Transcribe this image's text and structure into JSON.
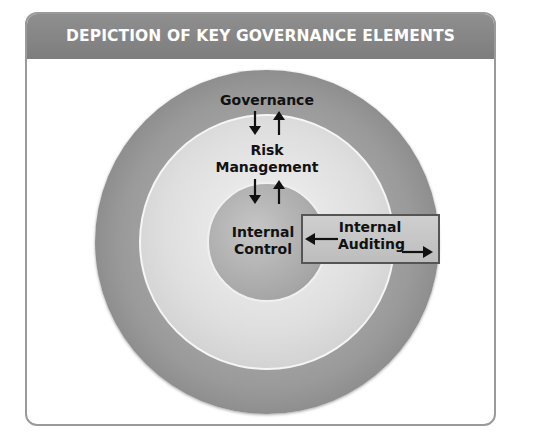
{
  "title": "DEPICTION OF KEY GOVERNANCE ELEMENTS",
  "layers": {
    "outer": {
      "label": "Governance"
    },
    "middle": {
      "label_line1": "Risk",
      "label_line2": "Management"
    },
    "inner": {
      "label_line1": "Internal",
      "label_line2": "Control"
    }
  },
  "side_box": {
    "label_line1": "Internal",
    "label_line2": "Auditing"
  },
  "relationships": [
    {
      "from": "Governance",
      "to": "Risk Management",
      "direction": "bidirectional"
    },
    {
      "from": "Risk Management",
      "to": "Internal Control",
      "direction": "bidirectional"
    },
    {
      "from": "Internal Auditing",
      "to": "Internal Control",
      "direction": "left"
    },
    {
      "from": "Internal Auditing",
      "to": "outside",
      "direction": "right"
    }
  ],
  "colors": {
    "header": "#888888",
    "frame_border": "#9a9a9a",
    "text": "#111111"
  }
}
